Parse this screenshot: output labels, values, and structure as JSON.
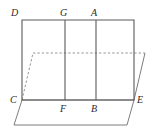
{
  "figure": {
    "type": "geometry-diagram",
    "stroke_color": "#555555",
    "dashed_color": "#777777",
    "label_color": "#2b2b2b",
    "background_color": "#ffffff",
    "canvas": {
      "width": 154,
      "height": 136
    },
    "points": [
      {
        "id": "D",
        "label": "D",
        "x": 22,
        "y": 20,
        "label_x": 11,
        "label_y": 8
      },
      {
        "id": "G",
        "label": "G",
        "x": 65,
        "y": 20,
        "label_x": 60,
        "label_y": 8
      },
      {
        "id": "A",
        "label": "A",
        "x": 96,
        "y": 20,
        "label_x": 91,
        "label_y": 8
      },
      {
        "id": "C",
        "label": "C",
        "x": 22,
        "y": 100,
        "label_x": 10,
        "label_y": 96
      },
      {
        "id": "F",
        "label": "F",
        "x": 65,
        "y": 100,
        "label_x": 60,
        "label_y": 104
      },
      {
        "id": "B",
        "label": "B",
        "x": 96,
        "y": 100,
        "label_x": 91,
        "label_y": 104
      },
      {
        "id": "E",
        "label": "E",
        "x": 134,
        "y": 100,
        "label_x": 137,
        "label_y": 96
      }
    ],
    "solid_paths": [
      {
        "name": "rectangle-outline",
        "d": "M 22 20 L 134 20 L 134 100 L 22 100 Z"
      },
      {
        "name": "segment-G-F",
        "d": "M 65 20 L 65 100"
      },
      {
        "name": "segment-A-B",
        "d": "M 96 20 L 96 100"
      },
      {
        "name": "base-plane-parallelogram",
        "d": "M 22 100 L 134 100 L 127 125 L 14 125 Z"
      }
    ],
    "dashed_paths": [
      {
        "name": "hidden-edge-line",
        "d": "M 33 53 L 145 53"
      },
      {
        "name": "hidden-edge-slant",
        "d": "M 22 100 L 33 53"
      }
    ],
    "plane_edges": [
      {
        "name": "plane-right-slant",
        "d": "M 134 100 L 145 53"
      }
    ]
  }
}
